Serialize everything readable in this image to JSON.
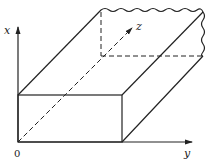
{
  "diagram": {
    "type": "3d-rectangular-slab",
    "axes": {
      "x": {
        "label": "x"
      },
      "y": {
        "label": "y"
      },
      "z": {
        "label": "z"
      },
      "origin": {
        "label": "0"
      }
    },
    "colors": {
      "stroke": "#222222",
      "background": "#ffffff"
    }
  }
}
